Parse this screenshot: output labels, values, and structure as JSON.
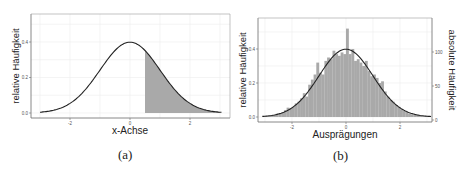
{
  "chart_data": [
    {
      "id": "a",
      "type": "area",
      "caption": "(a)",
      "title": "",
      "xlabel": "x-Achse",
      "ylabel": "relative Häufigkeit",
      "xticks": [
        "-2",
        "0",
        "2"
      ],
      "yticks": [
        "0.0",
        "0.2",
        "0.4"
      ],
      "xlim": [
        -3.0,
        3.0
      ],
      "ylim": [
        0.0,
        0.52
      ],
      "grid": true,
      "series": [
        {
          "name": "Standardnormalverteilung Dichte",
          "type": "line",
          "x": [
            -2.9,
            -2.5,
            -2.0,
            -1.5,
            -1.0,
            -0.5,
            0.0,
            0.5,
            1.0,
            1.5,
            2.0,
            2.5,
            2.9
          ],
          "values": [
            0.006,
            0.018,
            0.054,
            0.13,
            0.242,
            0.352,
            0.399,
            0.352,
            0.242,
            0.13,
            0.054,
            0.018,
            0.006
          ]
        },
        {
          "name": "schattierte Fläche",
          "type": "area",
          "x_from": 0.5,
          "x_to": 2.9
        }
      ]
    },
    {
      "id": "b",
      "type": "bar",
      "caption": "(b)",
      "title": "",
      "xlabel": "Ausprägungen",
      "ylabel": "relative Häufigkeit",
      "ylabel_right": "absolute Häufigkeit",
      "xticks": [
        "-2",
        "0",
        "2"
      ],
      "yticks": [
        "0.0",
        "0.2",
        "0.4"
      ],
      "yticks_right": [
        "0",
        "50",
        "100"
      ],
      "xlim": [
        -3.2,
        3.2
      ],
      "ylim": [
        0.0,
        0.56
      ],
      "grid": true,
      "series": [
        {
          "name": "Histogramm",
          "type": "bar",
          "x": [
            -3.0,
            -2.9,
            -2.8,
            -2.7,
            -2.6,
            -2.5,
            -2.4,
            -2.3,
            -2.2,
            -2.1,
            -2.0,
            -1.9,
            -1.8,
            -1.7,
            -1.6,
            -1.5,
            -1.4,
            -1.3,
            -1.2,
            -1.1,
            -1.0,
            -0.9,
            -0.8,
            -0.7,
            -0.6,
            -0.5,
            -0.4,
            -0.3,
            -0.2,
            -0.1,
            0.0,
            0.1,
            0.2,
            0.3,
            0.4,
            0.5,
            0.6,
            0.7,
            0.8,
            0.9,
            1.0,
            1.1,
            1.2,
            1.3,
            1.4,
            1.5,
            1.6,
            1.7,
            1.8,
            1.9,
            2.0,
            2.1,
            2.2,
            2.3,
            2.4,
            2.5,
            2.6,
            2.7,
            2.8,
            2.9
          ],
          "values": [
            0.004,
            0.006,
            0.01,
            0.012,
            0.02,
            0.018,
            0.025,
            0.04,
            0.055,
            0.05,
            0.06,
            0.08,
            0.09,
            0.11,
            0.14,
            0.12,
            0.19,
            0.22,
            0.25,
            0.32,
            0.26,
            0.25,
            0.33,
            0.35,
            0.34,
            0.39,
            0.37,
            0.36,
            0.38,
            0.37,
            0.52,
            0.37,
            0.4,
            0.33,
            0.34,
            0.32,
            0.3,
            0.33,
            0.27,
            0.24,
            0.25,
            0.23,
            0.2,
            0.21,
            0.15,
            0.12,
            0.1,
            0.09,
            0.07,
            0.06,
            0.045,
            0.035,
            0.03,
            0.02,
            0.015,
            0.012,
            0.015,
            0.008,
            0.005,
            0.004
          ]
        },
        {
          "name": "Dichtekurve",
          "type": "line",
          "x": [
            -3.0,
            -2.5,
            -2.0,
            -1.5,
            -1.0,
            -0.5,
            0.0,
            0.5,
            1.0,
            1.5,
            2.0,
            2.5,
            3.0
          ],
          "values": [
            0.004,
            0.018,
            0.054,
            0.13,
            0.242,
            0.352,
            0.399,
            0.352,
            0.242,
            0.13,
            0.054,
            0.018,
            0.004
          ]
        }
      ]
    }
  ],
  "captions": {
    "a": "(a)",
    "b": "(b)"
  },
  "colors": {
    "fill": "#a9a9a9",
    "line": "#222222",
    "frame": "#6b6b6b",
    "grid": "#ececec"
  }
}
